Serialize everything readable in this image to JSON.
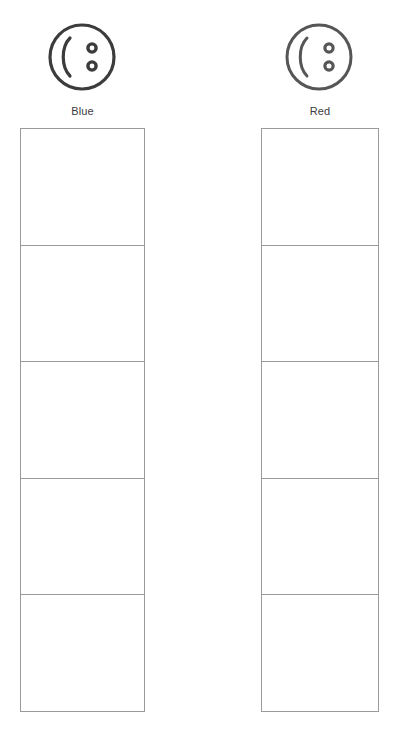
{
  "page": {
    "background_color": "#ffffff",
    "width": 397,
    "height": 736
  },
  "columns": [
    {
      "id": "blue",
      "label": "Blue",
      "icon": "rotated-smiley-face-icon",
      "icon_color": "#3c3c3c",
      "rows": [
        {
          "index": 1,
          "value": ""
        },
        {
          "index": 2,
          "value": ""
        },
        {
          "index": 3,
          "value": ""
        },
        {
          "index": 4,
          "value": ""
        },
        {
          "index": 5,
          "value": ""
        }
      ]
    },
    {
      "id": "red",
      "label": "Red",
      "icon": "rotated-smiley-face-icon",
      "icon_color": "#565656",
      "rows": [
        {
          "index": 1,
          "value": ""
        },
        {
          "index": 2,
          "value": ""
        },
        {
          "index": 3,
          "value": ""
        },
        {
          "index": 4,
          "value": ""
        },
        {
          "index": 5,
          "value": ""
        }
      ]
    }
  ],
  "grid": {
    "row_count": 5,
    "border_color": "#9a9a9a",
    "cell_background": "#ffffff"
  }
}
